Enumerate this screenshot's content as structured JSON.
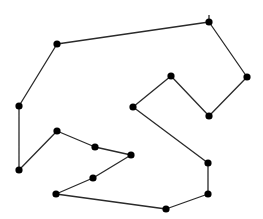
{
  "diagram": {
    "type": "closed-polygon-path",
    "background": "#ffffff",
    "stroke_color": "#2a2a2a",
    "node_color": "#000000",
    "stroke_width": 1.3,
    "node_radius": 3.6,
    "start_tick": {
      "x": 209,
      "y": 22,
      "length": 7
    },
    "nodes": [
      {
        "id": 0,
        "x": 209,
        "y": 22
      },
      {
        "id": 1,
        "x": 57,
        "y": 44
      },
      {
        "id": 2,
        "x": 19,
        "y": 106
      },
      {
        "id": 3,
        "x": 19,
        "y": 170
      },
      {
        "id": 4,
        "x": 57,
        "y": 131
      },
      {
        "id": 5,
        "x": 95,
        "y": 147
      },
      {
        "id": 6,
        "x": 131,
        "y": 155
      },
      {
        "id": 7,
        "x": 93,
        "y": 178
      },
      {
        "id": 8,
        "x": 56,
        "y": 194
      },
      {
        "id": 9,
        "x": 166,
        "y": 209
      },
      {
        "id": 10,
        "x": 208,
        "y": 194
      },
      {
        "id": 11,
        "x": 208,
        "y": 163
      },
      {
        "id": 12,
        "x": 133,
        "y": 107
      },
      {
        "id": 13,
        "x": 171,
        "y": 76
      },
      {
        "id": 14,
        "x": 209,
        "y": 116
      },
      {
        "id": 15,
        "x": 247,
        "y": 77
      }
    ],
    "closed": true
  }
}
